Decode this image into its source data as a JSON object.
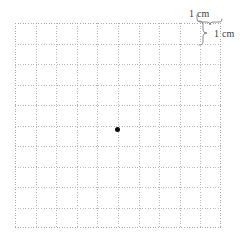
{
  "figure": {
    "kind": "centimeter-grid-diagram",
    "background_color": "#ffffff",
    "grid": {
      "columns": 10,
      "rows": 10,
      "cell_size_cm": 1,
      "line_style": "dotted",
      "line_color": "#b9b9bd",
      "left_px": 15,
      "top_px": 23,
      "width_px": 206,
      "height_px": 205,
      "cell_px": 20.6
    },
    "marker": {
      "type": "dot",
      "color": "#0b0b0b",
      "diameter_px": 5,
      "center_x_px": 117,
      "center_y_px": 129,
      "grid_col": 5,
      "grid_row": 5
    },
    "annotations": {
      "width_label": "1 cm",
      "height_label": "1 cm",
      "width_label_name": "cell-width-measure",
      "height_label_name": "cell-height-measure",
      "brace_color": "#6e6e73"
    }
  }
}
